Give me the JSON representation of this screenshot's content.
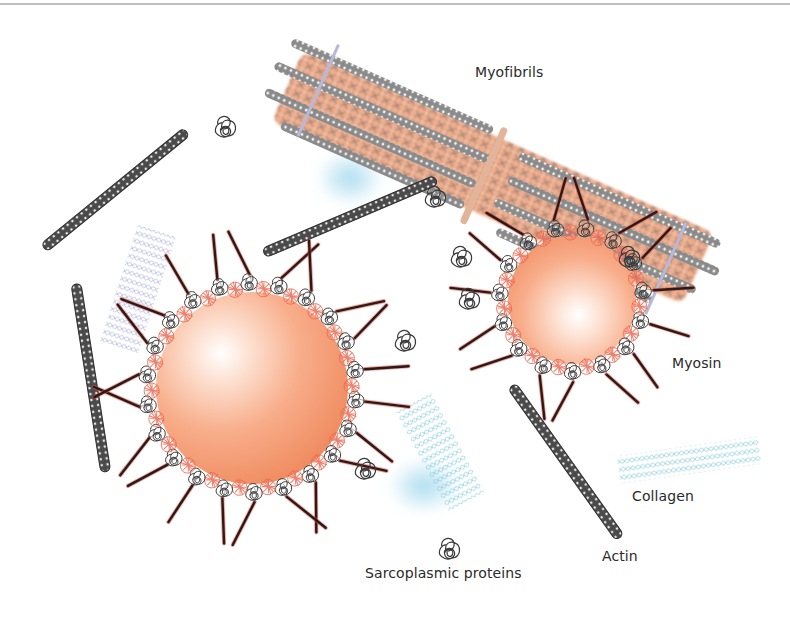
{
  "figure": {
    "width": 790,
    "height": 620,
    "background": "#ffffff",
    "border_top_color": "#bdbdbd"
  },
  "labels": {
    "myofibrils": {
      "text": "Myofibrils",
      "x": 475,
      "y": 64
    },
    "myosin": {
      "text": "Myosin",
      "x": 672,
      "y": 355
    },
    "collagen": {
      "text": "Collagen",
      "x": 632,
      "y": 488
    },
    "actin": {
      "text": "Actin",
      "x": 602,
      "y": 548
    },
    "sarcoplasmic": {
      "text": "Sarcoplasmic proteins",
      "x": 365,
      "y": 565
    }
  },
  "colors": {
    "fat_globule_light": "#ffffff",
    "fat_globule_mid": "#f8b79a",
    "fat_globule_dark": "#ef8a5e",
    "actin_fill": "#4a4a4a",
    "actin_dots": "#e6e6e6",
    "myosin_dark": "#2a1a1a",
    "myosin_red": "#e2523f",
    "coil_dark": "#3a3a3a",
    "coil_red": "#ee6a55",
    "collagen_blue": "#7fc6dc",
    "collagen_purple": "#9aa0d6",
    "water_blob": "#9bd6ec",
    "myofibril_orange": "#f0a27a",
    "z_disc": "#b8b8d8",
    "m_line": "#e2b49a"
  },
  "fat_globules": [
    {
      "name": "large",
      "cx": 252,
      "cy": 388,
      "r": 96
    },
    {
      "name": "small",
      "cx": 572,
      "cy": 300,
      "r": 64
    }
  ],
  "actin_filaments": [
    {
      "x1": 44,
      "y1": 248,
      "x2": 186,
      "y2": 132
    },
    {
      "x1": 264,
      "y1": 253,
      "x2": 436,
      "y2": 180
    },
    {
      "x1": 76,
      "y1": 284,
      "x2": 106,
      "y2": 472
    },
    {
      "x1": 512,
      "y1": 386,
      "x2": 620,
      "y2": 538
    }
  ],
  "water_blobs": [
    {
      "cx": 350,
      "cy": 178,
      "rx": 34,
      "ry": 28
    },
    {
      "cx": 424,
      "cy": 486,
      "rx": 36,
      "ry": 28
    }
  ],
  "collagen_patches": [
    {
      "name": "left-purple",
      "x": 118,
      "y": 228,
      "w": 40,
      "h": 120,
      "angle": 18,
      "color": "collagen_purple"
    },
    {
      "name": "center-blue",
      "x": 420,
      "y": 396,
      "w": 40,
      "h": 110,
      "angle": -28,
      "color": "collagen_blue"
    },
    {
      "name": "right-blue",
      "x": 618,
      "y": 446,
      "w": 142,
      "h": 28,
      "angle": -8,
      "color": "collagen_blue"
    }
  ],
  "free_coils": [
    {
      "cx": 226,
      "cy": 128
    },
    {
      "cx": 436,
      "cy": 198
    },
    {
      "cx": 462,
      "cy": 258
    },
    {
      "cx": 406,
      "cy": 342
    },
    {
      "cx": 366,
      "cy": 470
    },
    {
      "cx": 450,
      "cy": 550
    },
    {
      "cx": 630,
      "cy": 258
    },
    {
      "cx": 470,
      "cy": 300
    }
  ],
  "myofibril": {
    "x1": 290,
    "y1": 80,
    "x2": 700,
    "y2": 262,
    "z_discs": [
      {
        "x1": 330,
        "y1": 46,
        "x2": 300,
        "y2": 118
      },
      {
        "x1": 690,
        "y1": 210,
        "x2": 664,
        "y2": 272
      }
    ],
    "m_line": {
      "x1": 500,
      "y1": 130,
      "x2": 484,
      "y2": 190
    }
  }
}
